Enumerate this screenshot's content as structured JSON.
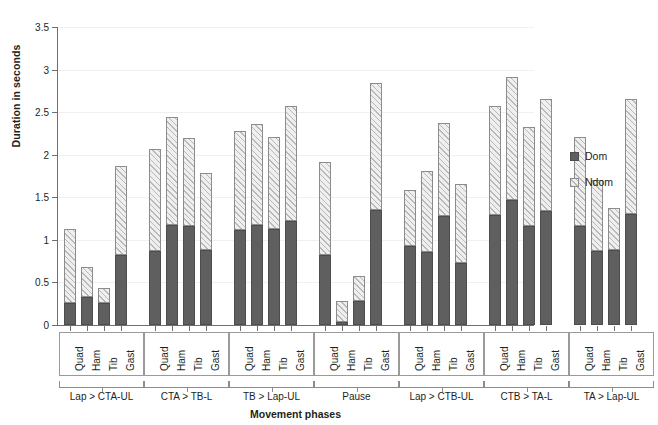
{
  "chart_data": {
    "type": "bar",
    "stacked": true,
    "title": "",
    "xlabel": "Movement phases",
    "ylabel": "Duration in seconds",
    "ylim": [
      0,
      3.5
    ],
    "yticks": [
      "0",
      "0.5",
      "1",
      "1.5",
      "2",
      "2.5",
      "3",
      "3.5"
    ],
    "ytick_values": [
      0,
      0.5,
      1,
      1.5,
      2,
      2.5,
      3,
      3.5
    ],
    "grid": "horizontal",
    "legend_position": "right",
    "categories": [
      "Quad",
      "Ham",
      "Tib",
      "Gast"
    ],
    "series": [
      {
        "name": "Dom",
        "color": "#5f5f5f"
      },
      {
        "name": "Ndom",
        "color": "#efefef"
      }
    ],
    "groups": [
      {
        "label": "Lap > CTA-UL",
        "bars": [
          {
            "category": "Quad",
            "dom": 0.26,
            "ndom": 0.87,
            "total": 1.13
          },
          {
            "category": "Ham",
            "dom": 0.33,
            "ndom": 0.35,
            "total": 0.68
          },
          {
            "category": "Tib",
            "dom": 0.26,
            "ndom": 0.18,
            "total": 0.44
          },
          {
            "category": "Gast",
            "dom": 0.82,
            "ndom": 1.05,
            "total": 1.87
          }
        ]
      },
      {
        "label": "CTA > TB-L",
        "bars": [
          {
            "category": "Quad",
            "dom": 0.87,
            "ndom": 1.2,
            "total": 2.07
          },
          {
            "category": "Ham",
            "dom": 1.17,
            "ndom": 1.27,
            "total": 2.44
          },
          {
            "category": "Tib",
            "dom": 1.16,
            "ndom": 1.04,
            "total": 2.2
          },
          {
            "category": "Gast",
            "dom": 0.88,
            "ndom": 0.9,
            "total": 1.78
          }
        ]
      },
      {
        "label": "TB > Lap-UL",
        "bars": [
          {
            "category": "Quad",
            "dom": 1.12,
            "ndom": 1.16,
            "total": 2.28
          },
          {
            "category": "Ham",
            "dom": 1.17,
            "ndom": 1.19,
            "total": 2.36
          },
          {
            "category": "Tib",
            "dom": 1.13,
            "ndom": 1.08,
            "total": 2.21
          },
          {
            "category": "Gast",
            "dom": 1.22,
            "ndom": 1.35,
            "total": 2.57
          }
        ]
      },
      {
        "label": "Pause",
        "bars": [
          {
            "category": "Quad",
            "dom": 0.82,
            "ndom": 1.1,
            "total": 1.92
          },
          {
            "category": "Ham",
            "dom": 0.04,
            "ndom": 0.24,
            "total": 0.28
          },
          {
            "category": "Tib",
            "dom": 0.28,
            "ndom": 0.29,
            "total": 0.57
          },
          {
            "category": "Gast",
            "dom": 1.35,
            "ndom": 1.49,
            "total": 2.84
          }
        ]
      },
      {
        "label": "Lap > CTB-UL",
        "bars": [
          {
            "category": "Quad",
            "dom": 0.93,
            "ndom": 0.66,
            "total": 1.59
          },
          {
            "category": "Ham",
            "dom": 0.86,
            "ndom": 0.95,
            "total": 1.81
          },
          {
            "category": "Tib",
            "dom": 1.28,
            "ndom": 1.09,
            "total": 2.37
          },
          {
            "category": "Gast",
            "dom": 0.73,
            "ndom": 0.93,
            "total": 1.66
          }
        ]
      },
      {
        "label": "CTB > TA-L",
        "bars": [
          {
            "category": "Quad",
            "dom": 1.29,
            "ndom": 1.28,
            "total": 2.57
          },
          {
            "category": "Ham",
            "dom": 1.47,
            "ndom": 1.44,
            "total": 2.91
          },
          {
            "category": "Tib",
            "dom": 1.16,
            "ndom": 1.16,
            "total": 2.32
          },
          {
            "category": "Gast",
            "dom": 1.34,
            "ndom": 1.31,
            "total": 2.65
          }
        ]
      },
      {
        "label": "TA > Lap-UL",
        "bars": [
          {
            "category": "Quad",
            "dom": 1.16,
            "ndom": 1.05,
            "total": 2.21
          },
          {
            "category": "Ham",
            "dom": 0.87,
            "ndom": 0.83,
            "total": 1.7
          },
          {
            "category": "Tib",
            "dom": 0.88,
            "ndom": 0.49,
            "total": 1.37
          },
          {
            "category": "Gast",
            "dom": 1.3,
            "ndom": 1.36,
            "total": 2.66
          }
        ]
      }
    ]
  }
}
